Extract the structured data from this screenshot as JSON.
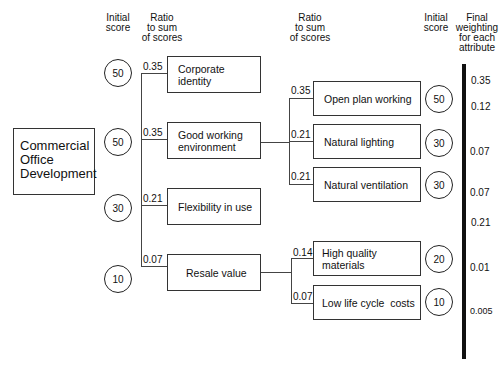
{
  "headers": {
    "left_initial_score": [
      "Initial",
      "score"
    ],
    "left_ratio": [
      "Ratio",
      "to sum",
      "of scores"
    ],
    "right_ratio": [
      "Ratio",
      "to sum",
      "of scores"
    ],
    "right_initial_score": [
      "Initial",
      "score"
    ],
    "final_weighting": [
      "Final",
      "weighting",
      "for each",
      "attribute"
    ]
  },
  "root": {
    "label_lines": [
      "Commercial",
      "Office",
      "Development"
    ]
  },
  "level1": [
    {
      "label_lines": [
        "Corporate identity"
      ],
      "initial_score": "50",
      "ratio": "0.35"
    },
    {
      "label_lines": [
        "Good working",
        "environment"
      ],
      "initial_score": "50",
      "ratio": "0.35"
    },
    {
      "label_lines": [
        "Flexibility in use"
      ],
      "initial_score": "30",
      "ratio": "0.21"
    },
    {
      "label_lines": [
        "Resale value"
      ],
      "initial_score": "10",
      "ratio": "0.07"
    }
  ],
  "level2": [
    {
      "parent": "Good working environment",
      "label": "Open plan working",
      "initial_score": "50",
      "ratio": "0.35"
    },
    {
      "parent": "Good working environment",
      "label": "Natural lighting",
      "initial_score": "30",
      "ratio": "0.21"
    },
    {
      "parent": "Good working environment",
      "label": "Natural ventilation",
      "initial_score": "30",
      "ratio": "0.21"
    },
    {
      "parent": "Resale value",
      "label": "High quality materials",
      "initial_score": "20",
      "ratio": "0.14"
    },
    {
      "parent": "Resale value",
      "label": "Low life cycle  costs",
      "initial_score": "10",
      "ratio": "0.07"
    }
  ],
  "final_weightings": [
    "0.35",
    "0.12",
    "0.07",
    "0.07",
    "0.21",
    "0.01",
    "0.005"
  ]
}
